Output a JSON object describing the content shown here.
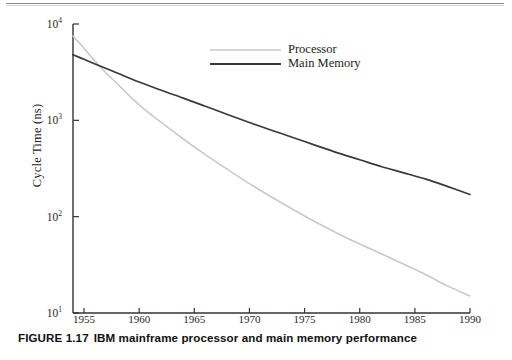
{
  "page": {
    "header_rule": "page-top-rule"
  },
  "caption": {
    "figure_number": "FIGURE 1.17",
    "text": "IBM mainframe processor and main memory performance"
  },
  "chart_data": {
    "type": "line",
    "title": "",
    "subtitle": "",
    "xlabel": "",
    "ylabel": "Cycle Time (ns)",
    "xlim": [
      1954,
      1990
    ],
    "ylim": [
      10,
      10000
    ],
    "yscale": "log",
    "xscale": "linear",
    "grid": false,
    "legend_position": "top-center",
    "x_ticks": [
      1955,
      1960,
      1965,
      1970,
      1975,
      1980,
      1985,
      1990
    ],
    "x_tick_labels": [
      "1955",
      "1960",
      "1965",
      "1970",
      "1975",
      "1980",
      "1985",
      "1990"
    ],
    "y_ticks": [
      10,
      100,
      1000,
      10000
    ],
    "y_tick_labels": [
      "10¹",
      "10²",
      "10³",
      "10⁴"
    ],
    "y_tick_bases": [
      "10",
      "10",
      "10",
      "10"
    ],
    "y_tick_exponents": [
      "1",
      "2",
      "3",
      "4"
    ],
    "series": [
      {
        "name": "Processor",
        "color": "#c9c9c9",
        "width": 1.6,
        "x": [
          1954,
          1955,
          1956,
          1957,
          1958,
          1959,
          1960,
          1962,
          1964,
          1966,
          1968,
          1970,
          1972,
          1974,
          1976,
          1978,
          1980,
          1982,
          1984,
          1986,
          1988,
          1990
        ],
        "y": [
          7500,
          5600,
          4100,
          3100,
          2400,
          1850,
          1450,
          950,
          640,
          440,
          310,
          220,
          160,
          118,
          88,
          67,
          52,
          41,
          32,
          25,
          19,
          15
        ]
      },
      {
        "name": "Main Memory",
        "color": "#3a3a3a",
        "width": 1.7,
        "x": [
          1954,
          1955,
          1956,
          1958,
          1960,
          1962,
          1964,
          1966,
          1968,
          1970,
          1972,
          1974,
          1976,
          1978,
          1980,
          1982,
          1984,
          1986,
          1988,
          1990
        ],
        "y": [
          4800,
          4300,
          3850,
          3100,
          2500,
          2050,
          1700,
          1400,
          1150,
          950,
          790,
          660,
          550,
          460,
          390,
          330,
          285,
          245,
          205,
          170
        ]
      }
    ],
    "legend": [
      {
        "label": "Processor",
        "color": "#c9c9c9"
      },
      {
        "label": "Main Memory",
        "color": "#3a3a3a"
      }
    ],
    "annotations": []
  },
  "colors": {
    "processor": "#c9c9c9",
    "main_memory": "#3a3a3a",
    "axis": "#333333",
    "text": "#1a1a1a"
  }
}
